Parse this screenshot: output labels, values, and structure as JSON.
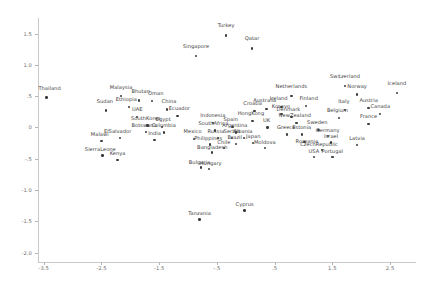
{
  "chart_data": {
    "type": "scatter",
    "title": "",
    "xlabel": "",
    "ylabel": "",
    "xlim": [
      -3.6,
      2.95
    ],
    "ylim": [
      -2.15,
      1.75
    ],
    "grid": false,
    "legend": null,
    "xticks": [
      "-3.5",
      "-2.5",
      "-1.5",
      "-.5",
      ".5",
      "1.5",
      "2.5"
    ],
    "xtick_values": [
      -3.5,
      -2.5,
      -1.5,
      -0.5,
      0.5,
      1.5,
      2.5
    ],
    "yticks": [
      "1.5",
      "1.0",
      ".5",
      "0",
      "-.5",
      "-1.0",
      "-1.5",
      "-2.0"
    ],
    "ytick_values": [
      1.5,
      1.0,
      0.5,
      0,
      -0.5,
      -1.0,
      -1.5,
      -2.0
    ],
    "point_label_field": "country",
    "points": [
      {
        "country": "Turkey",
        "x": -0.34,
        "y": 1.47,
        "lx": -0.34,
        "ly": 1.62
      },
      {
        "country": "Qatar",
        "x": 0.11,
        "y": 1.26,
        "lx": 0.11,
        "ly": 1.41
      },
      {
        "country": "Singapore",
        "x": -0.86,
        "y": 1.14,
        "lx": -0.86,
        "ly": 1.29
      },
      {
        "country": "Switzerland",
        "x": 1.72,
        "y": 0.66,
        "lx": 1.72,
        "ly": 0.81
      },
      {
        "country": "Iceland",
        "x": 2.62,
        "y": 0.55,
        "lx": 2.62,
        "ly": 0.7
      },
      {
        "country": "Norway",
        "x": 1.93,
        "y": 0.53,
        "lx": 1.93,
        "ly": 0.64
      },
      {
        "country": "Netherlands",
        "x": 0.79,
        "y": 0.5,
        "lx": 0.79,
        "ly": 0.64
      },
      {
        "country": "Thailand",
        "x": -3.45,
        "y": 0.48,
        "lx": -3.4,
        "ly": 0.62
      },
      {
        "country": "Malaysia",
        "x": -2.16,
        "y": 0.5,
        "lx": -2.16,
        "ly": 0.63
      },
      {
        "country": "Bhutan",
        "x": -1.85,
        "y": 0.43,
        "lx": -1.82,
        "ly": 0.56
      },
      {
        "country": "Oman",
        "x": -1.62,
        "y": 0.42,
        "lx": -1.56,
        "ly": 0.53
      },
      {
        "country": "Ireland",
        "x": 0.62,
        "y": 0.33,
        "lx": 0.57,
        "ly": 0.45
      },
      {
        "country": "Finland",
        "x": 1.04,
        "y": 0.34,
        "lx": 1.09,
        "ly": 0.45
      },
      {
        "country": "Austria",
        "x": 2.13,
        "y": 0.31,
        "lx": 2.13,
        "ly": 0.43
      },
      {
        "country": "Italy",
        "x": 1.72,
        "y": 0.28,
        "lx": 1.7,
        "ly": 0.4
      },
      {
        "country": "Australia",
        "x": 0.36,
        "y": 0.3,
        "lx": 0.33,
        "ly": 0.42
      },
      {
        "country": "Ethiopia",
        "x": -2.02,
        "y": 0.33,
        "lx": -2.07,
        "ly": 0.44
      },
      {
        "country": "Sudan",
        "x": -2.42,
        "y": 0.27,
        "lx": -2.44,
        "ly": 0.4
      },
      {
        "country": "China",
        "x": -1.36,
        "y": 0.29,
        "lx": -1.33,
        "ly": 0.41
      },
      {
        "country": "Croatia",
        "x": 0.15,
        "y": 0.26,
        "lx": 0.12,
        "ly": 0.37
      },
      {
        "country": "Kosovo",
        "x": 0.62,
        "y": 0.22,
        "lx": 0.61,
        "ly": 0.33
      },
      {
        "country": "Canada",
        "x": 2.33,
        "y": 0.22,
        "lx": 2.33,
        "ly": 0.33
      },
      {
        "country": "Denmark",
        "x": 0.79,
        "y": 0.17,
        "lx": 0.74,
        "ly": 0.28
      },
      {
        "country": "Belgium",
        "x": 1.62,
        "y": 0.15,
        "lx": 1.59,
        "ly": 0.26
      },
      {
        "country": "Ecuador",
        "x": -1.18,
        "y": 0.18,
        "lx": -1.15,
        "ly": 0.29
      },
      {
        "country": "UAE",
        "x": -1.88,
        "y": 0.17,
        "lx": -1.88,
        "ly": 0.28
      },
      {
        "country": "HongKong",
        "x": 0.12,
        "y": 0.1,
        "lx": 0.09,
        "ly": 0.21
      },
      {
        "country": "NewZealand",
        "x": 0.88,
        "y": 0.07,
        "lx": 0.85,
        "ly": 0.18
      },
      {
        "country": "France",
        "x": 2.13,
        "y": 0.06,
        "lx": 2.13,
        "ly": 0.17
      },
      {
        "country": "Indonesia",
        "x": -0.57,
        "y": 0.07,
        "lx": -0.57,
        "ly": 0.18
      },
      {
        "country": "SouthKorea",
        "x": -1.7,
        "y": 0.03,
        "lx": -1.73,
        "ly": 0.14
      },
      {
        "country": "Egypt",
        "x": -1.45,
        "y": 0.01,
        "lx": -1.43,
        "ly": 0.12
      },
      {
        "country": "Spain",
        "x": -0.23,
        "y": 0.01,
        "lx": -0.26,
        "ly": 0.12
      },
      {
        "country": "UK",
        "x": 0.38,
        "y": 0.0,
        "lx": 0.36,
        "ly": 0.11
      },
      {
        "country": "Sweden",
        "x": 1.26,
        "y": -0.04,
        "lx": 1.24,
        "ly": 0.07
      },
      {
        "country": "SouthAfrica",
        "x": -0.53,
        "y": -0.05,
        "lx": -0.56,
        "ly": 0.05
      },
      {
        "country": "Botswana",
        "x": -1.73,
        "y": -0.07,
        "lx": -1.76,
        "ly": 0.03
      },
      {
        "country": "Colombia",
        "x": -1.42,
        "y": -0.08,
        "lx": -1.42,
        "ly": 0.02
      },
      {
        "country": "Argentina",
        "x": -0.17,
        "y": -0.08,
        "lx": -0.19,
        "ly": 0.02
      },
      {
        "country": "Greece",
        "x": 0.72,
        "y": -0.11,
        "lx": 0.7,
        "ly": -0.01
      },
      {
        "country": "Estonia",
        "x": 0.97,
        "y": -0.11,
        "lx": 0.97,
        "ly": -0.01
      },
      {
        "country": "Germany",
        "x": 1.43,
        "y": -0.14,
        "lx": 1.42,
        "ly": -0.05
      },
      {
        "country": "Russia",
        "x": -0.48,
        "y": -0.17,
        "lx": -0.52,
        "ly": -0.07
      },
      {
        "country": "Serbia",
        "x": -0.24,
        "y": -0.17,
        "lx": -0.24,
        "ly": -0.07
      },
      {
        "country": "Albania",
        "x": -0.03,
        "y": -0.17,
        "lx": -0.05,
        "ly": -0.07
      },
      {
        "country": "Mexico",
        "x": -0.9,
        "y": -0.18,
        "lx": -0.92,
        "ly": -0.08
      },
      {
        "country": "India",
        "x": -1.58,
        "y": -0.2,
        "lx": -1.58,
        "ly": -0.1
      },
      {
        "country": "ElSalvador",
        "x": -2.18,
        "y": -0.17,
        "lx": -2.22,
        "ly": -0.07
      },
      {
        "country": "Malawi",
        "x": -2.5,
        "y": -0.22,
        "lx": -2.53,
        "ly": -0.12
      },
      {
        "country": "Romania",
        "x": 1.02,
        "y": -0.23,
        "lx": 1.06,
        "ly": -0.23
      },
      {
        "country": "Israel",
        "x": 1.48,
        "y": -0.24,
        "lx": 1.48,
        "ly": -0.15
      },
      {
        "country": "Latvia",
        "x": 1.93,
        "y": -0.28,
        "lx": 1.93,
        "ly": -0.19
      },
      {
        "country": "Brazil",
        "x": -0.17,
        "y": -0.26,
        "lx": -0.19,
        "ly": -0.17
      },
      {
        "country": "Japan",
        "x": 0.13,
        "y": -0.25,
        "lx": 0.13,
        "ly": -0.16
      },
      {
        "country": "Philippines",
        "x": -0.62,
        "y": -0.27,
        "lx": -0.65,
        "ly": -0.18
      },
      {
        "country": "Chile",
        "x": -0.38,
        "y": -0.33,
        "lx": -0.38,
        "ly": -0.25
      },
      {
        "country": "Moldova",
        "x": 0.33,
        "y": -0.33,
        "lx": 0.33,
        "ly": -0.24
      },
      {
        "country": "CzechRepublic",
        "x": 1.32,
        "y": -0.36,
        "lx": 1.27,
        "ly": -0.28
      },
      {
        "country": "Bangladesh",
        "x": -0.58,
        "y": -0.4,
        "lx": -0.58,
        "ly": -0.32
      },
      {
        "country": "USA",
        "x": 1.18,
        "y": -0.47,
        "lx": 1.18,
        "ly": -0.39
      },
      {
        "country": "Portugal",
        "x": 1.5,
        "y": -0.47,
        "lx": 1.5,
        "ly": -0.39
      },
      {
        "country": "SierraLeone",
        "x": -2.48,
        "y": -0.45,
        "lx": -2.52,
        "ly": -0.36
      },
      {
        "country": "Kenya",
        "x": -2.22,
        "y": -0.52,
        "lx": -2.22,
        "ly": -0.43
      },
      {
        "country": "Bulgaria",
        "x": -0.78,
        "y": -0.64,
        "lx": -0.8,
        "ly": -0.56
      },
      {
        "country": "Hungary",
        "x": -0.64,
        "y": -0.66,
        "lx": -0.61,
        "ly": -0.59
      },
      {
        "country": "Cyprus",
        "x": -0.02,
        "y": -1.33,
        "lx": -0.02,
        "ly": -1.24
      },
      {
        "country": "Tanzania",
        "x": -0.8,
        "y": -1.47,
        "lx": -0.8,
        "ly": -1.39
      }
    ]
  }
}
